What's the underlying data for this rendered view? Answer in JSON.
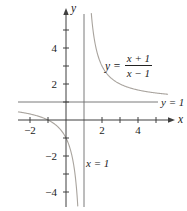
{
  "figure": {
    "background": "#ffffff"
  },
  "axes": {
    "x_label": "x",
    "y_label": "y"
  },
  "labels": {
    "horizontal_asymptote": "y = 1",
    "vertical_asymptote": "x = 1"
  },
  "equation": {
    "lhs": "y =",
    "numerator": "x + 1",
    "denominator": "x − 1"
  },
  "colors": {
    "curve": "#a9a49e",
    "axis": "#3f3f3f",
    "asymptote": "#6b6b6b",
    "text": "#222222"
  },
  "chart_data": {
    "type": "line",
    "title": "",
    "function": "y = (x + 1) / (x − 1)",
    "rational": {
      "numerator_coeffs": [
        1,
        1
      ],
      "denominator_coeffs": [
        1,
        -1
      ]
    },
    "asymptotes": {
      "vertical_x": 1,
      "horizontal_y": 1
    },
    "branches": [
      {
        "name": "left",
        "x_range": [
          -2.67,
          0.655
        ]
      },
      {
        "name": "right",
        "x_range": [
          1.405,
          5.67
        ]
      }
    ],
    "xlim": [
      -2.7,
      5.9
    ],
    "ylim": [
      -4.85,
      5.95
    ],
    "x_ticks": [
      -2,
      -1,
      2,
      3,
      4,
      5
    ],
    "y_ticks": [
      -4,
      -3,
      -2,
      -1,
      1,
      2,
      3,
      4,
      5
    ],
    "x_tick_labels": [
      {
        "value": -2,
        "text": "−2"
      },
      {
        "value": 2,
        "text": "2"
      },
      {
        "value": 4,
        "text": "4"
      }
    ],
    "y_tick_labels": [
      {
        "value": -4,
        "text": "−4"
      },
      {
        "value": -2,
        "text": "−2"
      },
      {
        "value": 2,
        "text": "2"
      },
      {
        "value": 4,
        "text": "4"
      }
    ],
    "key_points": [
      {
        "x": -1,
        "y": 0,
        "note": "x-intercept"
      },
      {
        "x": 0,
        "y": -1,
        "note": "y-intercept"
      }
    ],
    "grid": false,
    "legend": false
  }
}
